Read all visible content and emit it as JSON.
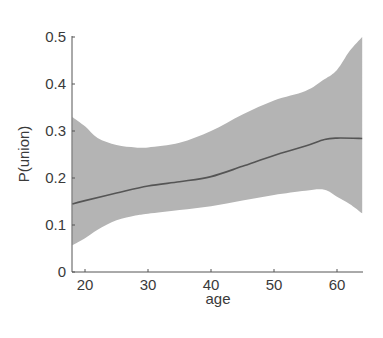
{
  "chart_data": {
    "type": "line",
    "title": "",
    "xlabel": "age",
    "ylabel": "P(union)",
    "xlim": [
      18,
      64
    ],
    "ylim": [
      0,
      0.5
    ],
    "xticks": [
      20,
      30,
      40,
      50,
      60
    ],
    "xtick_labels": [
      "20",
      "30",
      "40",
      "50",
      "60"
    ],
    "yticks": [
      0,
      0.1,
      0.2,
      0.3,
      0.4,
      0.5
    ],
    "ytick_labels": [
      "0",
      "0.1",
      "0.2",
      "0.3",
      "0.4",
      "0.5"
    ],
    "grid": false,
    "legend": null,
    "series": [
      {
        "name": "P(union) estimate",
        "kind": "line",
        "color": "#555555",
        "x": [
          18,
          20,
          25,
          30,
          35,
          40,
          45,
          50,
          55,
          58,
          60,
          64
        ],
        "y": [
          0.145,
          0.152,
          0.168,
          0.183,
          0.192,
          0.203,
          0.225,
          0.248,
          0.268,
          0.282,
          0.285,
          0.284
        ]
      },
      {
        "name": "confidence band",
        "kind": "area",
        "color": "#b4b4b4",
        "x": [
          18,
          20,
          22,
          25,
          28,
          30,
          35,
          40,
          45,
          50,
          55,
          58,
          60,
          62,
          64
        ],
        "upper": [
          0.33,
          0.31,
          0.285,
          0.27,
          0.265,
          0.265,
          0.275,
          0.3,
          0.335,
          0.365,
          0.385,
          0.41,
          0.43,
          0.47,
          0.5
        ],
        "lower": [
          0.057,
          0.072,
          0.09,
          0.11,
          0.12,
          0.124,
          0.132,
          0.14,
          0.152,
          0.164,
          0.173,
          0.175,
          0.16,
          0.145,
          0.125
        ]
      }
    ]
  }
}
